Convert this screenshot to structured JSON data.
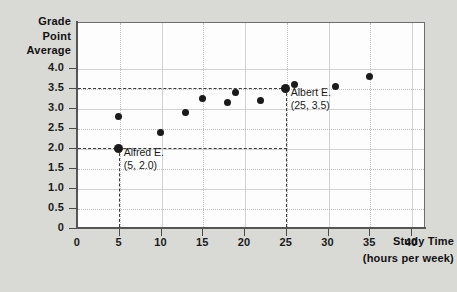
{
  "chart_data": {
    "type": "scatter",
    "title": "",
    "xlabel": "Study Time",
    "xlabel_unit": "(hours per week)",
    "ylabel_lines": [
      "Grade",
      "Point",
      "Average"
    ],
    "xlim": [
      0,
      42
    ],
    "ylim": [
      0,
      4.4
    ],
    "xticks": [
      0,
      5,
      10,
      15,
      20,
      25,
      30,
      35,
      40
    ],
    "xticklabels": [
      "0",
      "5",
      "10",
      "15",
      "20",
      "25",
      "30",
      "35",
      "40"
    ],
    "yticks": [
      0,
      0.5,
      1.0,
      1.5,
      2.0,
      2.5,
      3.0,
      3.5,
      4.0
    ],
    "yticklabels": [
      "0",
      "0.5",
      "1.0",
      "1.5",
      "2.0",
      "2.5",
      "3.0",
      "3.5",
      "4.0"
    ],
    "grid": true,
    "legend": false,
    "point_color": "#1a1a1a",
    "x": [
      5,
      5,
      10,
      13,
      15,
      18,
      19,
      22,
      25,
      26,
      31,
      35
    ],
    "y": [
      2.0,
      2.8,
      2.4,
      2.9,
      3.25,
      3.15,
      3.4,
      3.2,
      3.5,
      3.6,
      3.55,
      3.8
    ],
    "points": [
      {
        "x": 5,
        "y": 2.0,
        "label": "Alfred E.",
        "highlight": true
      },
      {
        "x": 5,
        "y": 2.8,
        "label": "",
        "highlight": false
      },
      {
        "x": 10,
        "y": 2.4,
        "label": "",
        "highlight": false
      },
      {
        "x": 13,
        "y": 2.9,
        "label": "",
        "highlight": false
      },
      {
        "x": 15,
        "y": 3.25,
        "label": "",
        "highlight": false
      },
      {
        "x": 18,
        "y": 3.15,
        "label": "",
        "highlight": false
      },
      {
        "x": 19,
        "y": 3.4,
        "label": "",
        "highlight": false
      },
      {
        "x": 22,
        "y": 3.2,
        "label": "",
        "highlight": false
      },
      {
        "x": 25,
        "y": 3.5,
        "label": "Albert E.",
        "highlight": true
      },
      {
        "x": 26,
        "y": 3.6,
        "label": "",
        "highlight": false
      },
      {
        "x": 31,
        "y": 3.55,
        "label": "",
        "highlight": false
      },
      {
        "x": 35,
        "y": 3.8,
        "label": "",
        "highlight": false
      }
    ],
    "annotations": [
      {
        "name": "alfred",
        "title": "Alfred E.",
        "coords": "(5, 2.0)",
        "point_x": 5,
        "point_y": 2.0
      },
      {
        "name": "albert",
        "title": "Albert E.",
        "coords": "(25, 3.5)",
        "point_x": 25,
        "point_y": 3.5
      }
    ]
  },
  "figure": {
    "background_color": "#d9d9d6",
    "plot_background_color": "#fdfdfd",
    "axis_color": "#555555",
    "grid_color": "#bdbdbd"
  }
}
